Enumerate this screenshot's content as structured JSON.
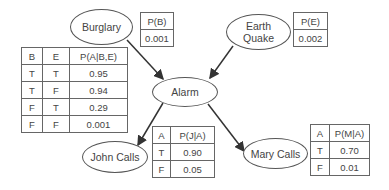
{
  "nodes": {
    "burglary": {
      "label": "Burglary"
    },
    "earthquake": {
      "label_line1": "Earth",
      "label_line2": "Quake"
    },
    "alarm": {
      "label": "Alarm"
    },
    "john": {
      "label": "John Calls"
    },
    "mary": {
      "label": "Mary Calls"
    }
  },
  "edges": [
    {
      "from": "Burglary",
      "to": "Alarm"
    },
    {
      "from": "Earth Quake",
      "to": "Alarm"
    },
    {
      "from": "Alarm",
      "to": "John Calls"
    },
    {
      "from": "Alarm",
      "to": "Mary Calls"
    }
  ],
  "tables": {
    "p_b": {
      "header": "P(B)",
      "value": "0.001"
    },
    "p_e": {
      "header": "P(E)",
      "value": "0.002"
    },
    "p_a": {
      "headers": [
        "B",
        "E",
        "P(A|B,E)"
      ],
      "rows": [
        [
          "T",
          "T",
          "0.95"
        ],
        [
          "T",
          "F",
          "0.94"
        ],
        [
          "F",
          "T",
          "0.29"
        ],
        [
          "F",
          "F",
          "0.001"
        ]
      ]
    },
    "p_j": {
      "headers": [
        "A",
        "P(J|A)"
      ],
      "rows": [
        [
          "T",
          "0.90"
        ],
        [
          "F",
          "0.05"
        ]
      ]
    },
    "p_m": {
      "headers": [
        "A",
        "P(M|A)"
      ],
      "rows": [
        [
          "T",
          "0.70"
        ],
        [
          "F",
          "0.01"
        ]
      ]
    }
  }
}
